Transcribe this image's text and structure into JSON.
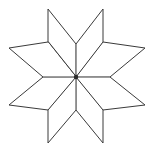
{
  "figure": {
    "subtitle": "LeMoyne star quilt block outline",
    "shape_name": "eight-pointed-star",
    "background_color": "#ffffff",
    "stroke_color": "#3a3a3a",
    "fill_color": "#ffffff",
    "stroke_width": 1,
    "center_dot_color": "#2b2b2b",
    "canvas": {
      "width": 161,
      "height": 151
    },
    "center": {
      "x": 76,
      "y": 77
    },
    "point_count": 8,
    "diamonds": [
      {
        "name": "diamond-north-west",
        "direction": "north-west",
        "points": "76,77 48,42 48,9 76,44"
      },
      {
        "name": "diamond-north-east",
        "direction": "north-east",
        "points": "76,77 76,44 103,9 103,42"
      },
      {
        "name": "diamond-east-north",
        "direction": "east-north",
        "points": "76,77 103,42 145,48 110,77"
      },
      {
        "name": "diamond-east-south",
        "direction": "east-south",
        "points": "76,77 110,77 145,105 103,110"
      },
      {
        "name": "diamond-south-east",
        "direction": "south-east",
        "points": "76,77 103,110 103,143 76,110"
      },
      {
        "name": "diamond-south-west",
        "direction": "south-west",
        "points": "76,77 76,110 48,143 48,110"
      },
      {
        "name": "diamond-west-south",
        "direction": "west-south",
        "points": "76,77 48,110 9,105 43,77"
      },
      {
        "name": "diamond-west-north",
        "direction": "west-north",
        "points": "76,77 43,77 9,48 48,42"
      }
    ],
    "tips": [
      {
        "name": "tip-top-left",
        "x": 48,
        "y": 9
      },
      {
        "name": "tip-top-right",
        "x": 103,
        "y": 9
      },
      {
        "name": "tip-right-top",
        "x": 145,
        "y": 48
      },
      {
        "name": "tip-right-bottom",
        "x": 145,
        "y": 105
      },
      {
        "name": "tip-bottom-right",
        "x": 103,
        "y": 143
      },
      {
        "name": "tip-bottom-left",
        "x": 48,
        "y": 143
      },
      {
        "name": "tip-left-bottom",
        "x": 9,
        "y": 105
      },
      {
        "name": "tip-left-top",
        "x": 9,
        "y": 48
      }
    ],
    "inner_vertices": [
      {
        "name": "inner-north",
        "x": 76,
        "y": 44
      },
      {
        "name": "inner-north-east",
        "x": 103,
        "y": 42
      },
      {
        "name": "inner-east",
        "x": 110,
        "y": 77
      },
      {
        "name": "inner-south-east",
        "x": 103,
        "y": 110
      },
      {
        "name": "inner-south",
        "x": 76,
        "y": 110
      },
      {
        "name": "inner-south-west",
        "x": 48,
        "y": 110
      },
      {
        "name": "inner-west",
        "x": 43,
        "y": 77
      },
      {
        "name": "inner-north-west",
        "x": 48,
        "y": 42
      }
    ],
    "center_dot_radius": 2.2
  }
}
